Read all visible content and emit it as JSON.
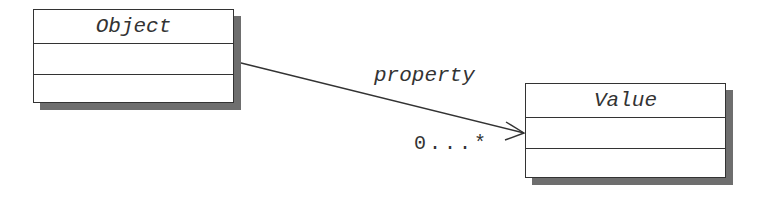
{
  "diagram": {
    "type": "UML class diagram",
    "classes": [
      {
        "id": "object",
        "name": "Object",
        "compartments": 2
      },
      {
        "id": "value",
        "name": "Value",
        "compartments": 2
      }
    ],
    "association": {
      "from": "Object",
      "to": "Value",
      "role": "property",
      "multiplicity": "0...*",
      "arrowhead": "open"
    }
  }
}
